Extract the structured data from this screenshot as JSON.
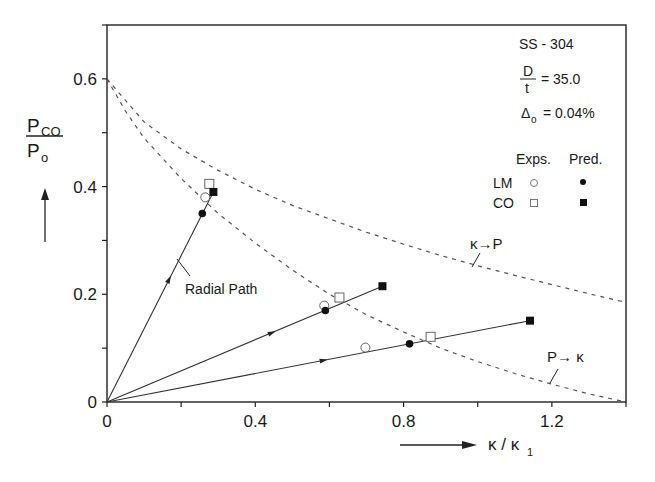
{
  "chart_data": {
    "type": "line",
    "title": "",
    "xlabel": "κ / κ1",
    "ylabel": "P_CO / P_o",
    "xlim": [
      0,
      1.4
    ],
    "ylim": [
      0,
      0.7
    ],
    "x_ticks": [
      0,
      0.4,
      0.8,
      1.2
    ],
    "x_tick_labels": [
      "0",
      "0.4",
      "0.8",
      "1.2"
    ],
    "y_ticks": [
      0,
      0.2,
      0.4,
      0.6
    ],
    "y_tick_labels": [
      "0",
      "0.2",
      "0.4",
      "0.6"
    ],
    "grid": false,
    "annotations": {
      "material": "SS - 304",
      "dt_label_num": "D",
      "dt_label_den": "t",
      "dt_value": "= 35.0",
      "delta_label": "Δ",
      "delta_sub": "o",
      "delta_value": "= 0.04%",
      "radial_path": "Radial Path",
      "kappa_to_p": "κ→P",
      "p_to_kappa": "P→ κ"
    },
    "legend": {
      "col_headers": [
        "Exps.",
        "Pred."
      ],
      "rows": [
        {
          "label": "LM",
          "exp_marker": "open-circle",
          "pred_marker": "filled-circle"
        },
        {
          "label": "CO",
          "exp_marker": "open-square",
          "pred_marker": "filled-square"
        }
      ],
      "position": "upper-right"
    },
    "series": [
      {
        "name": "κ→P limit curve",
        "style": "dashed",
        "x": [
          0,
          0.05,
          0.1,
          0.2,
          0.3,
          0.4,
          0.5,
          0.6,
          0.7,
          0.8,
          0.9,
          1.0,
          1.1,
          1.2,
          1.3,
          1.4
        ],
        "y": [
          0.6,
          0.56,
          0.52,
          0.47,
          0.43,
          0.395,
          0.365,
          0.34,
          0.315,
          0.293,
          0.272,
          0.253,
          0.235,
          0.218,
          0.201,
          0.185
        ]
      },
      {
        "name": "P→κ limit curve",
        "style": "dashed",
        "x": [
          0,
          0.05,
          0.1,
          0.2,
          0.3,
          0.4,
          0.5,
          0.6,
          0.7,
          0.8,
          0.9,
          1.0,
          1.1,
          1.2,
          1.3,
          1.4
        ],
        "y": [
          0.6,
          0.54,
          0.49,
          0.415,
          0.35,
          0.295,
          0.245,
          0.2,
          0.162,
          0.13,
          0.1,
          0.075,
          0.053,
          0.033,
          0.015,
          0.0
        ]
      },
      {
        "name": "Radial path 1",
        "style": "solid",
        "x": [
          0,
          0.287
        ],
        "y": [
          0,
          0.39
        ]
      },
      {
        "name": "Radial path 2",
        "style": "solid",
        "x": [
          0,
          0.743
        ],
        "y": [
          0,
          0.215
        ]
      },
      {
        "name": "Radial path 3",
        "style": "solid",
        "x": [
          0,
          1.141
        ],
        "y": [
          0,
          0.151
        ]
      },
      {
        "name": "LM Exps.",
        "marker": "open-circle",
        "x": [
          0.265,
          0.586,
          0.697
        ],
        "y": [
          0.38,
          0.179,
          0.101
        ]
      },
      {
        "name": "LM Pred.",
        "marker": "filled-circle",
        "x": [
          0.257,
          0.589,
          0.816
        ],
        "y": [
          0.35,
          0.17,
          0.108
        ]
      },
      {
        "name": "CO Exps.",
        "marker": "open-square",
        "x": [
          0.276,
          0.627,
          0.873
        ],
        "y": [
          0.405,
          0.194,
          0.121
        ]
      },
      {
        "name": "CO Pred.",
        "marker": "filled-square",
        "x": [
          0.287,
          0.743,
          1.141
        ],
        "y": [
          0.39,
          0.215,
          0.151
        ]
      }
    ],
    "path_arrows": [
      {
        "x": 0.17,
        "y": 0.231
      },
      {
        "x": 0.45,
        "y": 0.13
      },
      {
        "x": 0.59,
        "y": 0.078
      }
    ]
  }
}
